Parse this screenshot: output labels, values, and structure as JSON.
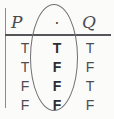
{
  "figure": {
    "type": "truth-table",
    "caption_operator": "·"
  },
  "headers": {
    "left": "P",
    "operator": "·",
    "right": "Q"
  },
  "columns": {
    "p": {
      "label": "P",
      "values": [
        "T",
        "T",
        "F",
        "F"
      ]
    },
    "result": {
      "label": "·",
      "values": [
        "T",
        "F",
        "F",
        "F"
      ]
    },
    "q": {
      "label": "Q",
      "values": [
        "T",
        "F",
        "T",
        "F"
      ]
    }
  },
  "annotation": {
    "shape": "ellipse",
    "target": "result-column"
  },
  "colors": {
    "background": "#fbfbfa",
    "rule": "#55555a",
    "text": "#4d4d51",
    "emphasis_text": "#2e2e31",
    "ellipse": "#6f6f74"
  }
}
